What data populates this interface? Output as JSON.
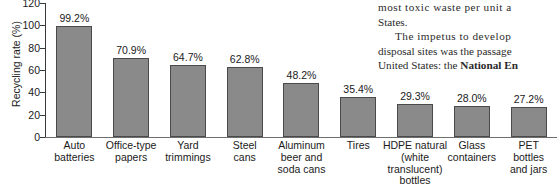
{
  "book_text": {
    "lines": [
      "most toxic waste per unit a",
      "States.",
      "The impetus to develop",
      "disposal sites was the passage",
      "United States: the "
    ],
    "bold_fragment": "National En"
  },
  "chart_data": {
    "type": "bar",
    "title": "",
    "xlabel": "",
    "ylabel": "Recycling rate (%)",
    "ylim": [
      0,
      120
    ],
    "yticks": [
      0,
      20,
      40,
      60,
      80,
      100,
      120
    ],
    "grid": false,
    "legend": "none",
    "bar_color": "#8a8a8a",
    "bar_edge_color": "#4a4a4a",
    "categories": [
      "Auto batteries",
      "Office-type papers",
      "Yard trimmings",
      "Steel cans",
      "Aluminum beer and soda cans",
      "Tires",
      "HDPE natural (white translucent) bottles",
      "Glass containers",
      "PET bottles and jars"
    ],
    "category_lines": [
      [
        "Auto",
        "batteries"
      ],
      [
        "Office-type",
        "papers"
      ],
      [
        "Yard",
        "trimmings"
      ],
      [
        "Steel",
        "cans"
      ],
      [
        "Aluminum",
        "beer and",
        "soda cans"
      ],
      [
        "Tires"
      ],
      [
        "HDPE natural",
        "(white",
        "translucent)",
        "bottles"
      ],
      [
        "Glass",
        "containers"
      ],
      [
        "PET",
        "bottles",
        "and jars"
      ]
    ],
    "values": [
      99.2,
      70.9,
      64.7,
      62.8,
      48.2,
      35.4,
      29.3,
      28.0,
      27.2
    ],
    "data_labels": [
      "99.2%",
      "70.9%",
      "64.7%",
      "62.8%",
      "48.2%",
      "35.4%",
      "29.3%",
      "28.0%",
      "27.2%"
    ]
  }
}
